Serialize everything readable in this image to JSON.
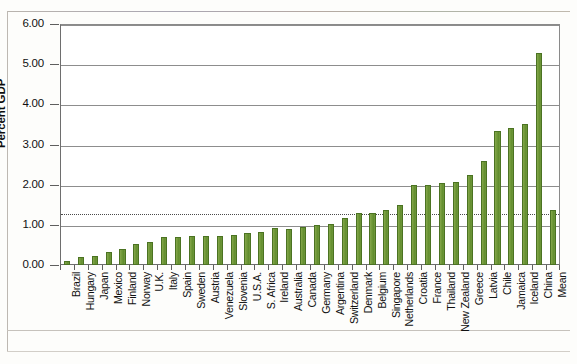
{
  "chart_data": {
    "type": "bar",
    "title": "",
    "xlabel": "",
    "ylabel": "Percent GDP",
    "ylim": [
      0,
      6
    ],
    "ytick_labels": [
      "0.00",
      "1.00",
      "2.00",
      "3.00",
      "4.00",
      "5.00",
      "6.00"
    ],
    "ytick_values": [
      0,
      1,
      2,
      3,
      4,
      5,
      6
    ],
    "grid": "horizontal",
    "legend": "none",
    "reference_line": {
      "label": "",
      "value": 1.3,
      "style": "dotted"
    },
    "bar_color": "#6c9635",
    "bar_border_color": "#4b7322",
    "categories": [
      "Brazil",
      "Hungary",
      "Japan",
      "Mexico",
      "Finland",
      "Norway",
      "U.K.",
      "Italy",
      "Spain",
      "Sweden",
      "Austria",
      "Venezuela",
      "Slovenia",
      "U.S.A.",
      "S. Africa",
      "Ireland",
      "Australia",
      "Canada",
      "Germany",
      "Argentina",
      "Switzerland",
      "Denmark",
      "Belgium",
      "Singapore",
      "Netherlands",
      "Croatia",
      "France",
      "Thailand",
      "New Zealand",
      "Greece",
      "Latvia",
      "Chile",
      "Jamaica",
      "Iceland",
      "China",
      "Mean"
    ],
    "values": [
      0.1,
      0.2,
      0.23,
      0.33,
      0.4,
      0.53,
      0.57,
      0.7,
      0.7,
      0.73,
      0.72,
      0.72,
      0.75,
      0.8,
      0.82,
      0.92,
      0.9,
      0.95,
      1.0,
      1.02,
      1.17,
      1.3,
      1.3,
      1.37,
      1.5,
      1.98,
      2.0,
      2.05,
      2.07,
      2.23,
      2.6,
      3.33,
      3.4,
      3.5,
      5.27,
      1.38
    ]
  }
}
